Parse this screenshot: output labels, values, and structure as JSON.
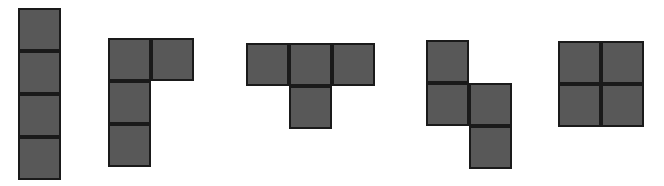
{
  "canvas": {
    "width": 664,
    "height": 186,
    "background_color": "#ffffff"
  },
  "style": {
    "fill_color": "#585858",
    "border_color": "#1a1a1a",
    "border_width": 2,
    "cell_size": 43
  },
  "shapes": [
    {
      "name": "shape-1-i-tetromino",
      "label": "I-tetromino",
      "origin_x": 18,
      "origin_y": 8,
      "cells": [
        {
          "col": 0,
          "row": 0
        },
        {
          "col": 0,
          "row": 1
        },
        {
          "col": 0,
          "row": 2
        },
        {
          "col": 0,
          "row": 3
        }
      ]
    },
    {
      "name": "shape-2-j-tetromino",
      "label": "J-tetromino",
      "origin_x": 108,
      "origin_y": 38,
      "cells": [
        {
          "col": 0,
          "row": 0
        },
        {
          "col": 1,
          "row": 0
        },
        {
          "col": 0,
          "row": 1
        },
        {
          "col": 0,
          "row": 2
        }
      ]
    },
    {
      "name": "shape-3-t-tetromino",
      "label": "T-tetromino",
      "origin_x": 246,
      "origin_y": 43,
      "cells": [
        {
          "col": 0,
          "row": 0
        },
        {
          "col": 1,
          "row": 0
        },
        {
          "col": 2,
          "row": 0
        },
        {
          "col": 1,
          "row": 1
        }
      ]
    },
    {
      "name": "shape-4-s-tetromino",
      "label": "S-tetromino",
      "origin_x": 426,
      "origin_y": 40,
      "cells": [
        {
          "col": 0,
          "row": 0
        },
        {
          "col": 0,
          "row": 1
        },
        {
          "col": 1,
          "row": 1
        },
        {
          "col": 1,
          "row": 2
        }
      ]
    },
    {
      "name": "shape-5-o-tetromino",
      "label": "O-tetromino",
      "origin_x": 558,
      "origin_y": 41,
      "cells": [
        {
          "col": 0,
          "row": 0
        },
        {
          "col": 1,
          "row": 0
        },
        {
          "col": 0,
          "row": 1
        },
        {
          "col": 1,
          "row": 1
        }
      ]
    }
  ]
}
